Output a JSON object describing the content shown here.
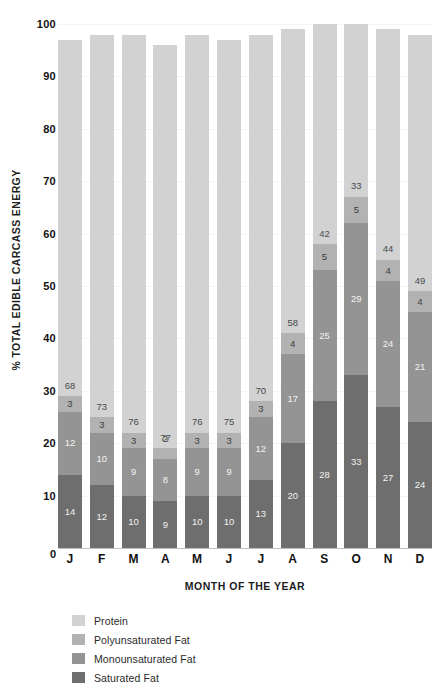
{
  "chart_data": {
    "type": "bar",
    "subtype": "stacked-bar",
    "title": "",
    "xlabel": "MONTH OF THE YEAR",
    "ylabel": "% TOTAL EDIBLE CARCASS ENERGY",
    "ylim": [
      0,
      100
    ],
    "yticks": [
      100,
      90,
      80,
      70,
      60,
      50,
      40,
      30,
      20,
      10,
      0
    ],
    "grid": true,
    "legend_position": "bottom-left",
    "categories": [
      "J",
      "F",
      "M",
      "A",
      "M",
      "J",
      "J",
      "A",
      "S",
      "O",
      "N",
      "D"
    ],
    "stack_order_bottom_to_top": [
      "Saturated Fat",
      "Monounsaturated Fat",
      "Polyunsaturated Fat",
      "Protein"
    ],
    "series": [
      {
        "name": "Saturated Fat",
        "color": "#6e6e6e",
        "values": [
          14,
          12,
          10,
          9,
          10,
          10,
          13,
          20,
          28,
          33,
          27,
          24
        ]
      },
      {
        "name": "Monounsaturated Fat",
        "color": "#949494",
        "values": [
          12,
          10,
          9,
          8,
          9,
          9,
          12,
          17,
          25,
          29,
          24,
          21
        ]
      },
      {
        "name": "Polyunsaturated Fat",
        "color": "#b2b2b2",
        "values": [
          3,
          3,
          3,
          2,
          3,
          3,
          3,
          4,
          5,
          5,
          4,
          4
        ]
      },
      {
        "name": "Protein",
        "color": "#d2d2d2",
        "values": [
          68,
          73,
          76,
          77,
          76,
          75,
          70,
          58,
          42,
          33,
          44,
          49
        ]
      }
    ]
  },
  "legend": {
    "items": [
      {
        "label": "Protein",
        "color": "#d2d2d2"
      },
      {
        "label": "Polyunsaturated Fat",
        "color": "#b2b2b2"
      },
      {
        "label": "Monounsaturated Fat",
        "color": "#949494"
      },
      {
        "label": "Saturated Fat",
        "color": "#6e6e6e"
      }
    ]
  },
  "axes": {
    "y_title": "% TOTAL EDIBLE CARCASS ENERGY",
    "x_title": "MONTH OF THE YEAR",
    "zero_label": "0"
  }
}
